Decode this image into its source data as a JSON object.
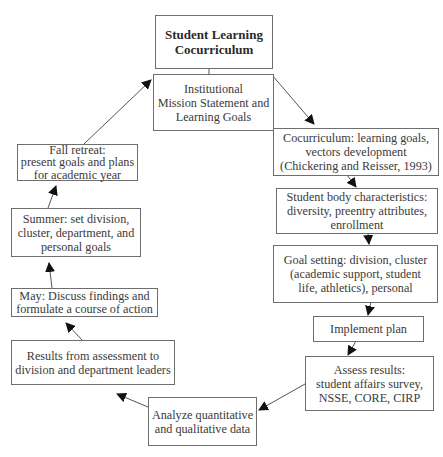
{
  "diagram": {
    "cut_title": "Figure: Student Learning Cocurriculum Cycle",
    "nodes": {
      "title": "Student Learning\nCocurriculum",
      "mission": "Institutional\nMission Statement and\nLearning Goals",
      "cocurriculum": "Cocurriculum: learning goals,\nvectors development\n(Chickering and Reisser, 1993)",
      "student_body": "Student body characteristics:\ndiversity, preentry attributes,\nenrollment",
      "goal_setting": "Goal setting: division, cluster\n(academic support, student\nlife, athletics), personal",
      "implement": "Implement plan",
      "assess": "Assess results:\nstudent affairs survey,\nNSSE, CORE, CIRP",
      "analyze": "Analyze quantitative\nand qualitative data",
      "results": "Results from assessment to\ndivision and department leaders",
      "may": "May: Discuss findings and\nformulate a course of action",
      "summer": "Summer: set division,\ncluster, department, and\npersonal goals",
      "fall": "Fall retreat:\npresent goals and plans\nfor academic year"
    },
    "edges": [
      {
        "from": "title",
        "to": "mission",
        "arrow": false
      },
      {
        "from": "mission",
        "to": "cocurriculum",
        "arrow": true
      },
      {
        "from": "cocurriculum",
        "to": "student_body",
        "arrow": true
      },
      {
        "from": "student_body",
        "to": "goal_setting",
        "arrow": true
      },
      {
        "from": "goal_setting",
        "to": "implement",
        "arrow": true
      },
      {
        "from": "implement",
        "to": "assess",
        "arrow": true
      },
      {
        "from": "assess",
        "to": "analyze",
        "arrow": true
      },
      {
        "from": "analyze",
        "to": "results",
        "arrow": true
      },
      {
        "from": "results",
        "to": "may",
        "arrow": true
      },
      {
        "from": "may",
        "to": "summer",
        "arrow": true
      },
      {
        "from": "summer",
        "to": "fall",
        "arrow": true
      },
      {
        "from": "fall",
        "to": "mission",
        "arrow": true
      }
    ],
    "colors": {
      "border": "#6e6e6e",
      "arrow": "#555555",
      "arrowhead": "#111111",
      "text": "#3a3a3a"
    }
  }
}
